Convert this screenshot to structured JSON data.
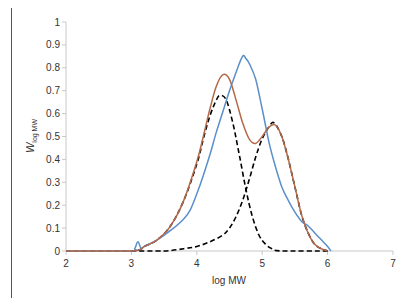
{
  "chart_data": {
    "type": "line",
    "title": "",
    "xlabel": "log MW",
    "ylabel_main": "W",
    "ylabel_sub": "log MW",
    "xlim": [
      2,
      7
    ],
    "ylim": [
      0,
      1
    ],
    "xticks": [
      "2",
      "3",
      "4",
      "5",
      "6",
      "7"
    ],
    "yticks": [
      "0",
      "0.1",
      "0.2",
      "0.3",
      "0.4",
      "0.5",
      "0.6",
      "0.7",
      "0.8",
      "0.9",
      "1"
    ],
    "grid": false,
    "legend": "none",
    "series": [
      {
        "name": "measured",
        "style": "solid",
        "color": "#5b8fc9",
        "x": [
          2.0,
          3.0,
          3.05,
          3.1,
          3.15,
          3.2,
          3.4,
          3.6,
          3.8,
          3.9,
          4.0,
          4.1,
          4.2,
          4.3,
          4.4,
          4.5,
          4.6,
          4.7,
          4.75,
          4.8,
          4.9,
          5.0,
          5.1,
          5.2,
          5.3,
          5.4,
          5.5,
          5.6,
          5.7,
          5.8,
          5.9,
          6.0,
          6.05
        ],
        "y": [
          0.0,
          0.0,
          0.01,
          0.04,
          0.01,
          0.02,
          0.05,
          0.09,
          0.14,
          0.18,
          0.25,
          0.33,
          0.42,
          0.52,
          0.61,
          0.7,
          0.78,
          0.85,
          0.84,
          0.82,
          0.75,
          0.62,
          0.48,
          0.37,
          0.28,
          0.22,
          0.17,
          0.13,
          0.11,
          0.08,
          0.05,
          0.02,
          0.0
        ]
      },
      {
        "name": "fit-total",
        "style": "solid",
        "color": "#b5694a",
        "x": [
          2.0,
          3.0,
          3.2,
          3.4,
          3.6,
          3.8,
          4.0,
          4.1,
          4.2,
          4.3,
          4.4,
          4.5,
          4.6,
          4.7,
          4.8,
          4.9,
          5.0,
          5.1,
          5.2,
          5.3,
          5.4,
          5.5,
          5.6,
          5.7,
          5.8,
          5.9,
          6.0
        ],
        "y": [
          0.0,
          0.0,
          0.02,
          0.05,
          0.11,
          0.22,
          0.39,
          0.5,
          0.62,
          0.72,
          0.77,
          0.75,
          0.66,
          0.56,
          0.49,
          0.47,
          0.5,
          0.54,
          0.55,
          0.5,
          0.4,
          0.28,
          0.16,
          0.08,
          0.03,
          0.01,
          0.0
        ]
      },
      {
        "name": "component-1",
        "style": "dashed",
        "color": "#000000",
        "x": [
          2.0,
          3.0,
          3.2,
          3.4,
          3.6,
          3.8,
          4.0,
          4.1,
          4.2,
          4.3,
          4.36,
          4.45,
          4.55,
          4.65,
          4.75,
          4.85,
          4.95,
          5.05,
          5.15,
          5.3,
          6.0
        ],
        "y": [
          0.0,
          0.0,
          0.02,
          0.05,
          0.11,
          0.22,
          0.38,
          0.49,
          0.59,
          0.66,
          0.68,
          0.66,
          0.56,
          0.42,
          0.27,
          0.15,
          0.07,
          0.03,
          0.01,
          0.0,
          0.0
        ]
      },
      {
        "name": "component-2",
        "style": "dashed",
        "color": "#000000",
        "x": [
          3.0,
          3.5,
          3.8,
          4.0,
          4.2,
          4.4,
          4.5,
          4.6,
          4.7,
          4.8,
          4.9,
          5.0,
          5.1,
          5.18,
          5.3,
          5.4,
          5.5,
          5.6,
          5.7,
          5.8,
          5.9,
          6.0
        ],
        "y": [
          0.0,
          0.0,
          0.01,
          0.02,
          0.04,
          0.07,
          0.1,
          0.15,
          0.22,
          0.31,
          0.41,
          0.49,
          0.54,
          0.56,
          0.5,
          0.4,
          0.28,
          0.16,
          0.08,
          0.03,
          0.01,
          0.0
        ]
      }
    ]
  }
}
